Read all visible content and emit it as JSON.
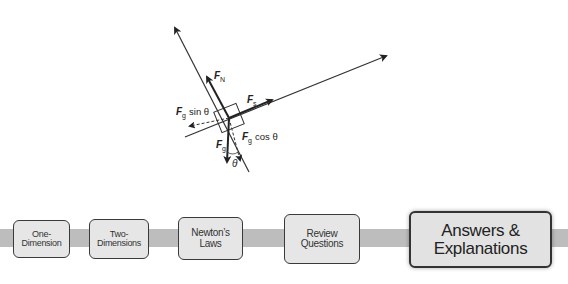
{
  "diagram": {
    "labels": {
      "normal_force": "F",
      "normal_sub": "N",
      "static_friction": "F",
      "static_sub": "s",
      "gravity_sin": "F",
      "gravity_sin_sub": "g",
      "gravity_sin_suffix": "sin θ",
      "gravity_cos": "F",
      "gravity_cos_sub": "g",
      "gravity_cos_suffix": "cos θ",
      "gravity": "F",
      "gravity_sub": "g",
      "angle": "θ"
    }
  },
  "nav": {
    "items": [
      {
        "line1": "One-",
        "line2": "Dimension"
      },
      {
        "line1": "Two-",
        "line2": "Dimensions"
      },
      {
        "label": "Newton’s Laws"
      },
      {
        "label": "Review Questions"
      },
      {
        "line1": "Answers &",
        "line2": "Explanations"
      }
    ],
    "colors": {
      "band": "#bdbdbd",
      "box_fill": "#e6e6e6",
      "box_border": "#3a3a3a"
    }
  }
}
